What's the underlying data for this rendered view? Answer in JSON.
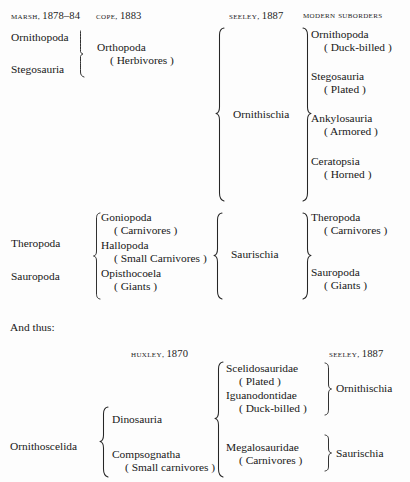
{
  "page": {
    "background_color": "#fdfdfd",
    "text_color": "#181818",
    "connector_text": "And thus:"
  },
  "top_table": {
    "headers": [
      {
        "name": "MARSH",
        "year": "1878–84",
        "full": "MARSH, 1878–84"
      },
      {
        "name": "COPE",
        "year": "1883",
        "full": "COPE, 1883"
      },
      {
        "name": "SEELEY",
        "year": "1887",
        "full": "SEELEY, 1887"
      },
      {
        "name": "MODERN SUBORDERS",
        "year": "",
        "full": "MODERN SUBORDERS"
      }
    ],
    "marsh_column": [
      "Ornithopoda",
      "Stegosauria",
      "Theropoda",
      "Sauropoda"
    ],
    "cope_column": [
      {
        "taxon": "Orthopoda",
        "note": "( Herbivores )"
      },
      {
        "taxon": "Goniopoda",
        "note": "( Carnivores )"
      },
      {
        "taxon": "Hallopoda",
        "note": "( Small Carnivores )"
      },
      {
        "taxon": "Opisthocoela",
        "note": "( Giants )"
      }
    ],
    "seeley_column": [
      "Ornithischia",
      "Saurischia"
    ],
    "modern_suborders": [
      {
        "taxon": "Ornithopoda",
        "note": "( Duck-billed )"
      },
      {
        "taxon": "Stegosauria",
        "note": "( Plated )"
      },
      {
        "taxon": "Ankylosauria",
        "note": "( Armored )"
      },
      {
        "taxon": "Ceratopsia",
        "note": "( Horned )"
      },
      {
        "taxon": "Theropoda",
        "note": "( Carnivores )"
      },
      {
        "taxon": "Sauropoda",
        "note": "( Giants )"
      }
    ]
  },
  "bottom_table": {
    "headers": [
      {
        "name": "HUXLEY",
        "year": "1870",
        "full": "HUXLEY, 1870"
      },
      {
        "name": "SEELEY",
        "year": "1887",
        "full": "SEELEY, 1887"
      }
    ],
    "root": "Ornithoscelida",
    "huxley_column": [
      {
        "taxon": "Dinosauria",
        "note": ""
      },
      {
        "taxon": "Compsognatha",
        "note": "( Small carnivores )"
      }
    ],
    "families": [
      {
        "taxon": "Scelidosauridae",
        "note": "( Plated )"
      },
      {
        "taxon": "Iguanodontidae",
        "note": "( Duck-billed )"
      },
      {
        "taxon": "Megalosauridae",
        "note": "( Carnivores )"
      }
    ],
    "seeley_column": [
      "Ornithischia",
      "Saurischia"
    ]
  }
}
